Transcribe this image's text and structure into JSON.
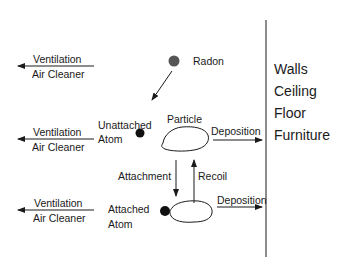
{
  "diagram": {
    "nodes": {
      "radon": "Radon",
      "unattached_atom": [
        "Unattached",
        "Atom"
      ],
      "particle": "Particle",
      "attached_atom": [
        "Attached",
        "Atom"
      ]
    },
    "removal": {
      "top": [
        "Ventilation",
        "Air Cleaner"
      ],
      "middle": [
        "Ventilation",
        "Air Cleaner"
      ],
      "bottom": [
        "Ventilation",
        "Air Cleaner"
      ]
    },
    "processes": {
      "attachment": "Attachment",
      "recoil": "Recoil",
      "deposition_upper": "Deposition",
      "deposition_lower": "Deposition"
    },
    "surfaces": [
      "Walls",
      "Ceiling",
      "Floor",
      "Furniture"
    ],
    "colors": {
      "line": "#1a1a1a",
      "radon_fill": "#555555",
      "atom_fill": "#111111"
    }
  }
}
